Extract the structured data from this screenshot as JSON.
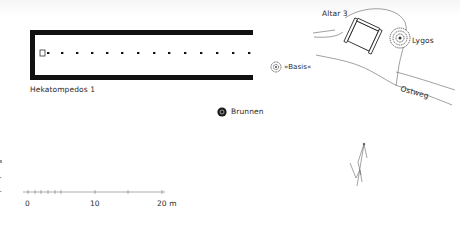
{
  "map": {
    "labels": {
      "hekatompedos": "Hekatompedos 1",
      "altar": "Altar 3",
      "lygos": "Lygos",
      "basis": "»Basis«",
      "brunnen": "Brunnen",
      "ostweg": "Ostweg"
    },
    "scale_bar": {
      "ticks": [
        "0",
        "10",
        "20 m"
      ],
      "unit": "m"
    },
    "north_arrow": "N",
    "colors": {
      "wall": "#111111",
      "line": "#555555",
      "background": "#ffffff"
    }
  }
}
